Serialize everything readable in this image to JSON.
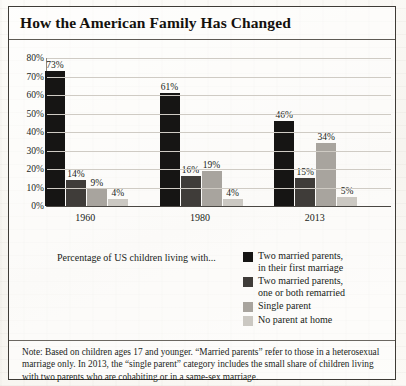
{
  "title": "How the American Family Has Changed",
  "legend_caption": "Percentage of US children living with...",
  "footnote": "Note: Based on children ages 17 and younger. “Married parents” refer to those in a heterosexual marriage only. In 2013, the “single parent” category includes the small share of children living with two parents who are cohabiting or in a same-sex marriage.",
  "colors": {
    "series1": "#161514",
    "series2": "#3f3c39",
    "series3": "#a8a49e",
    "series4": "#cbc8c2",
    "gridline": "#cfcbc4",
    "axis": "#4a4743",
    "paper": "#fbfaf7",
    "text": "#201d19"
  },
  "chart_data": {
    "type": "bar",
    "title": "How the American Family Has Changed",
    "xlabel": "",
    "ylabel": "",
    "ylim": [
      0,
      80
    ],
    "yticks": [
      "0%",
      "10%",
      "20%",
      "30%",
      "40%",
      "50%",
      "60%",
      "70%",
      "80%"
    ],
    "ytick_values": [
      0,
      10,
      20,
      30,
      40,
      50,
      60,
      70,
      80
    ],
    "grid": true,
    "legend_position": "bottom-right",
    "categories": [
      "1960",
      "1980",
      "2013"
    ],
    "series": [
      {
        "name": "Two married parents,\nin their first marriage",
        "color": "#161514",
        "values": [
          73,
          61,
          46
        ],
        "labels": [
          "73%",
          "61%",
          "46%"
        ]
      },
      {
        "name": "Two married parents,\none or both remarried",
        "color": "#3f3c39",
        "values": [
          14,
          16,
          15
        ],
        "labels": [
          "14%",
          "16%",
          "15%"
        ]
      },
      {
        "name": "Single parent",
        "color": "#a8a49e",
        "values": [
          9,
          19,
          34
        ],
        "labels": [
          "9%",
          "19%",
          "34%"
        ]
      },
      {
        "name": "No parent at home",
        "color": "#cbc8c2",
        "values": [
          4,
          4,
          5
        ],
        "labels": [
          "4%",
          "4%",
          "5%"
        ]
      }
    ]
  }
}
